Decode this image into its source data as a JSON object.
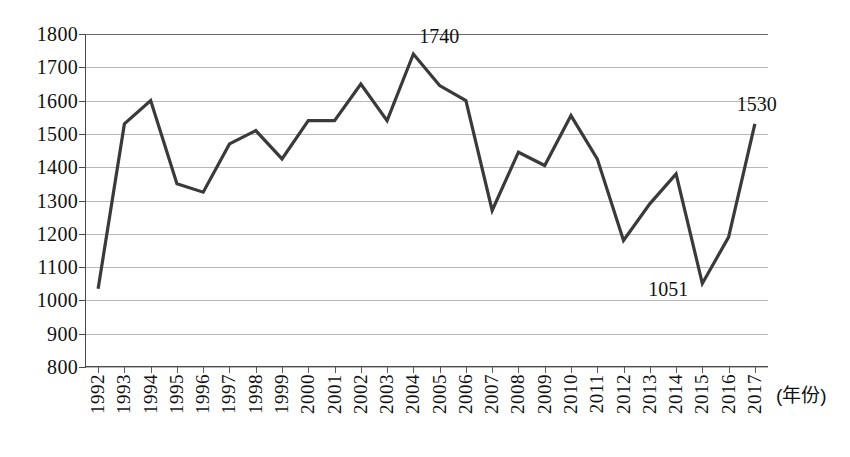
{
  "chart_data": {
    "type": "line",
    "title": "",
    "xlabel": "(年份)",
    "ylabel": "",
    "ylim": [
      800,
      1800
    ],
    "y_ticks": [
      800,
      900,
      1000,
      1100,
      1200,
      1300,
      1400,
      1500,
      1600,
      1700,
      1800
    ],
    "grid": true,
    "legend": "none",
    "categories": [
      "1992",
      "1993",
      "1994",
      "1995",
      "1996",
      "1997",
      "1998",
      "1999",
      "2000",
      "2001",
      "2002",
      "2003",
      "2004",
      "2005",
      "2006",
      "2007",
      "2008",
      "2009",
      "2010",
      "2011",
      "2012",
      "2013",
      "2014",
      "2015",
      "2016",
      "2017"
    ],
    "values": [
      1035,
      1530,
      1600,
      1350,
      1325,
      1470,
      1510,
      1425,
      1540,
      1540,
      1650,
      1540,
      1740,
      1645,
      1600,
      1270,
      1445,
      1405,
      1555,
      1425,
      1180,
      1290,
      1380,
      1051,
      1190,
      1530
    ],
    "annotations": [
      {
        "label": "1740",
        "category": "2004",
        "value": 1740
      },
      {
        "label": "1051",
        "category": "2015",
        "value": 1051
      },
      {
        "label": "1530",
        "category": "2017",
        "value": 1530
      }
    ],
    "line_color": "#3a3a3a",
    "grid_color": "#b8b8b8",
    "axis_color": "#4a4a4a"
  }
}
